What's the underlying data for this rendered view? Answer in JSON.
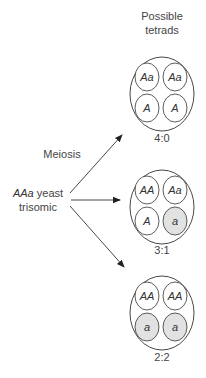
{
  "header": {
    "line1": "Possible",
    "line2": "tetrads"
  },
  "source": {
    "genotype": "AAa",
    "line1_rest": " yeast",
    "line2": "trisomic"
  },
  "process_label": "Meiosis",
  "colors": {
    "line": "#333333",
    "shaded_spore": "#e2e2e2",
    "spore_fill": "#ffffff",
    "text": "#444444"
  },
  "tetrads": [
    {
      "ratio": "4:0",
      "spores": [
        {
          "genotype": "Aa",
          "shaded": false
        },
        {
          "genotype": "Aa",
          "shaded": false
        },
        {
          "genotype": "A",
          "shaded": false
        },
        {
          "genotype": "A",
          "shaded": false
        }
      ]
    },
    {
      "ratio": "3:1",
      "spores": [
        {
          "genotype": "AA",
          "shaded": false
        },
        {
          "genotype": "Aa",
          "shaded": false
        },
        {
          "genotype": "A",
          "shaded": false
        },
        {
          "genotype": "a",
          "shaded": true
        }
      ]
    },
    {
      "ratio": "2:2",
      "spores": [
        {
          "genotype": "AA",
          "shaded": false
        },
        {
          "genotype": "AA",
          "shaded": false
        },
        {
          "genotype": "a",
          "shaded": true
        },
        {
          "genotype": "a",
          "shaded": true
        }
      ]
    }
  ]
}
